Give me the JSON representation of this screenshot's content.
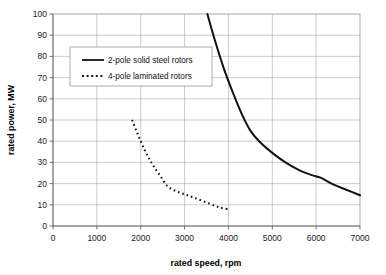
{
  "chart_data": {
    "type": "line",
    "title": "",
    "xlabel": "rated speed, rpm",
    "ylabel": "rated power, MW",
    "xlim": [
      0,
      7000
    ],
    "ylim": [
      0,
      100
    ],
    "xticks": [
      0,
      1000,
      2000,
      3000,
      4000,
      5000,
      6000,
      7000
    ],
    "yticks": [
      0,
      10,
      20,
      30,
      40,
      50,
      60,
      70,
      80,
      90,
      100
    ],
    "xtick_labels": [
      "0",
      "1000",
      "2000",
      "3000",
      "4000",
      "5000",
      "6000",
      "7000"
    ],
    "ytick_labels": [
      "0",
      "10",
      "20",
      "30",
      "40",
      "50",
      "60",
      "70",
      "80",
      "90",
      "100"
    ],
    "grid": "both",
    "legend_position": "upper-left-inside",
    "series": [
      {
        "name": "2-pole solid steel  rotors",
        "style": "solid",
        "color": "#121212",
        "x": [
          3520,
          3700,
          3900,
          4100,
          4300,
          4500,
          4700,
          5000,
          5300,
          5600,
          5900,
          6100,
          6400,
          6700,
          7000
        ],
        "y": [
          100,
          87,
          74,
          63,
          53,
          45,
          40,
          34.5,
          30,
          26.5,
          24,
          22.8,
          19.5,
          17,
          14.5
        ]
      },
      {
        "name": "4-pole laminated rotors",
        "style": "dotted",
        "color": "#121212",
        "x": [
          1800,
          1900,
          2000,
          2100,
          2200,
          2300,
          2450,
          2600,
          2800,
          3000,
          3200,
          3450,
          3700,
          3850,
          4000
        ],
        "y": [
          50,
          45,
          40,
          35.5,
          31.5,
          28,
          23.5,
          19,
          16.5,
          15,
          13.5,
          11.5,
          9.5,
          8.5,
          8
        ]
      }
    ]
  },
  "legend": {
    "entries": [
      {
        "label": "2-pole solid steel  rotors",
        "style": "solid"
      },
      {
        "label": "4-pole laminated rotors",
        "style": "dotted"
      }
    ]
  },
  "axes": {
    "x_title": "rated speed, rpm",
    "y_title": "rated power, MW"
  }
}
